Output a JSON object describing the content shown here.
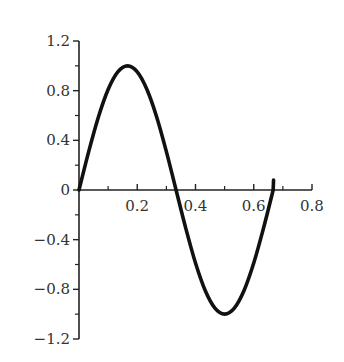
{
  "chart_data": {
    "type": "line",
    "title": "",
    "xlabel": "",
    "ylabel": "",
    "xlim": [
      0,
      0.8
    ],
    "ylim": [
      -1.2,
      1.2
    ],
    "grid": false,
    "legend": null,
    "x_ticks": [
      0.2,
      0.4,
      0.6,
      0.8
    ],
    "x_tick_labels": [
      "0.2",
      "0.4",
      "0.6",
      "0.8"
    ],
    "x_minor_ticks": [
      0.1,
      0.3,
      0.5,
      0.7
    ],
    "y_ticks": [
      1.2,
      0.8,
      0.4,
      0,
      -0.4,
      -0.8,
      -1.2
    ],
    "y_tick_labels": [
      "1.2",
      "0.8",
      "0.4",
      "0",
      "−0.4",
      "−0.8",
      "−1.2"
    ],
    "y_minor_ticks": [
      1.0,
      0.6,
      0.2,
      -0.2,
      -0.6,
      -1.0
    ],
    "series": [
      {
        "name": "sin(3πx)",
        "color": "#111111",
        "x": [
          0,
          0.0333,
          0.0667,
          0.1,
          0.1333,
          0.1667,
          0.2,
          0.2333,
          0.2667,
          0.3,
          0.3333,
          0.3667,
          0.4,
          0.4333,
          0.4667,
          0.5,
          0.5333,
          0.5667,
          0.6,
          0.6333,
          0.6667
        ],
        "y": [
          0,
          0.309,
          0.588,
          0.809,
          0.951,
          1.0,
          0.951,
          0.809,
          0.588,
          0.309,
          0,
          -0.309,
          -0.588,
          -0.809,
          -0.951,
          -1.0,
          -0.951,
          -0.809,
          -0.588,
          -0.309,
          0
        ]
      }
    ]
  }
}
